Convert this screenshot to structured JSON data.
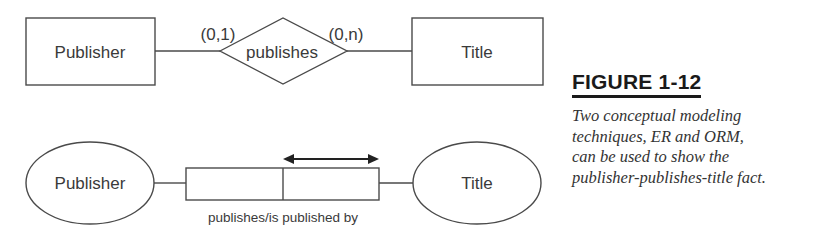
{
  "er_diagram": {
    "entity_left": "Publisher",
    "relationship": "publishes",
    "entity_right": "Title",
    "cardinality_left": "(0,1)",
    "cardinality_right": "(0,n)"
  },
  "orm_diagram": {
    "object_left": "Publisher",
    "object_right": "Title",
    "fact_reading": "publishes/is published by",
    "uniqueness_constraint": "double-arrow over right role"
  },
  "figure": {
    "label": "FIGURE 1-12",
    "caption_lines": [
      "Two conceptual modeling",
      "techniques, ER and ORM,",
      "can be used to show the",
      "publisher-publishes-title fact."
    ]
  },
  "colors": {
    "line": "#4a4a4a",
    "text": "#3a3a3a"
  }
}
